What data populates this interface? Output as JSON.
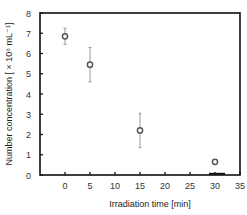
{
  "chart_data": {
    "type": "scatter",
    "title": "",
    "xlabel": "Irradiation time [min]",
    "ylabel": "Number concentration [ × 10⁶ mL⁻¹]",
    "xlim": [
      -5,
      35
    ],
    "ylim": [
      0,
      8
    ],
    "x_ticks": [
      0,
      5,
      10,
      15,
      20,
      25,
      30,
      35
    ],
    "y_ticks": [
      0,
      1,
      2,
      3,
      4,
      5,
      6,
      7,
      8
    ],
    "grid": false,
    "legend": null,
    "series": [
      {
        "name": "Number concentration",
        "marker": "open-circle",
        "x": [
          0,
          5,
          15,
          30
        ],
        "y": [
          6.85,
          5.45,
          2.2,
          0.65
        ],
        "yerr": [
          0.4,
          0.85,
          0.85,
          0.0
        ]
      }
    ],
    "annotations": [
      "Short horizontal bar near x=30 on the x-axis"
    ]
  },
  "colors": {
    "axis": "#111111",
    "marker": "#555555",
    "errorbar": "#999999"
  }
}
